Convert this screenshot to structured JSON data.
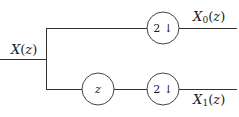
{
  "diagram": {
    "background_color": "#ffffff",
    "wire_color": "#333333",
    "block_stroke_color": "#444444",
    "text_color": "#1a1a1a",
    "width": 239,
    "height": 117
  },
  "labels": {
    "input": {
      "base": "X",
      "subscript": "",
      "argument": "(z)",
      "full_text": "X(z)",
      "position": "above-left-of-input-wire"
    },
    "output_top": {
      "base": "X",
      "subscript": "0",
      "argument": "(z)",
      "full_text": "X0(z)",
      "position": "above-top-output-wire"
    },
    "output_bottom": {
      "base": "X",
      "subscript": "1",
      "argument": "(z)",
      "full_text": "X1(z)",
      "position": "below-bottom-output-wire"
    }
  },
  "blocks": {
    "downsampler_top": {
      "factor": "2",
      "arrow": "↓",
      "text": "2 ↓",
      "type": "downsampler",
      "branch": "top",
      "cx": 163,
      "cy": 28,
      "r": 16
    },
    "delay_bottom": {
      "text": "z",
      "type": "advance",
      "branch": "bottom",
      "cx": 98,
      "cy": 89,
      "r": 16
    },
    "downsampler_bottom": {
      "factor": "2",
      "arrow": "↓",
      "text": "2 ↓",
      "type": "downsampler",
      "branch": "bottom",
      "cx": 163,
      "cy": 89,
      "r": 16
    }
  },
  "wires": {
    "input_line": "M 0 59 L 46 59",
    "split_bar": "M 46 28 L 46 89",
    "top_in": "M 46 28 L 147 28",
    "top_out": "M 179 28 L 237 28",
    "bottom_in": "M 46 89 L 82 89",
    "bottom_mid": "M 114 89 L 147 89",
    "bottom_out": "M 179 89 L 237 89"
  }
}
